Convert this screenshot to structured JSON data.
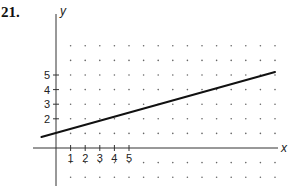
{
  "problem_number": "21.",
  "chart_data": {
    "type": "line",
    "title": "",
    "xlabel": "x",
    "ylabel": "y",
    "x_tick_labels": [
      "1",
      "2",
      "3",
      "4",
      "5"
    ],
    "y_tick_labels": [
      "2",
      "3",
      "4",
      "5"
    ],
    "grid": "dot grid",
    "xlim": [
      -1,
      15
    ],
    "ylim": [
      -2,
      7
    ],
    "series": [
      {
        "name": "line",
        "x": [
          -1,
          0,
          4,
          15
        ],
        "y": [
          0.75,
          1,
          2.1,
          5.2
        ]
      }
    ]
  }
}
